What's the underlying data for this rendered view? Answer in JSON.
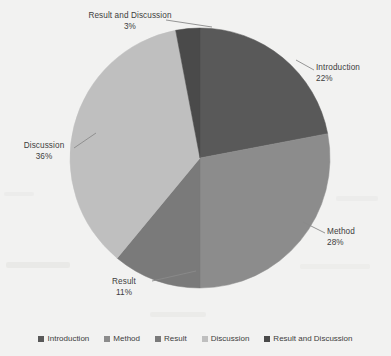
{
  "chart_data": {
    "type": "pie",
    "title": "",
    "categories": [
      "Introduction",
      "Method",
      "Result",
      "Discussion",
      "Result and Discussion"
    ],
    "values": [
      22,
      28,
      11,
      36,
      3
    ],
    "value_labels": [
      "22%",
      "28%",
      "11%",
      "36%",
      "3%"
    ],
    "unit": "%",
    "colors": [
      "#595959",
      "#8c8c8c",
      "#7a7a7a",
      "#bfbfbf",
      "#4a4a4a"
    ],
    "start_angle_deg": 0,
    "direction": "clockwise",
    "legend_position": "bottom",
    "grid": false
  },
  "labels": {
    "result_and_discussion": {
      "name": "Result and Discussion",
      "pct": "3%"
    },
    "introduction": {
      "name": "Introduction",
      "pct": "22%"
    },
    "method": {
      "name": "Method",
      "pct": "28%"
    },
    "result": {
      "name": "Result",
      "pct": "11%"
    },
    "discussion": {
      "name": "Discussion",
      "pct": "36%"
    }
  },
  "legend": {
    "items": [
      {
        "label": "Introduction",
        "color": "#595959"
      },
      {
        "label": "Method",
        "color": "#8c8c8c"
      },
      {
        "label": "Result",
        "color": "#7a7a7a"
      },
      {
        "label": "Discussion",
        "color": "#bfbfbf"
      },
      {
        "label": "Result and Discussion",
        "color": "#4a4a4a"
      }
    ]
  }
}
